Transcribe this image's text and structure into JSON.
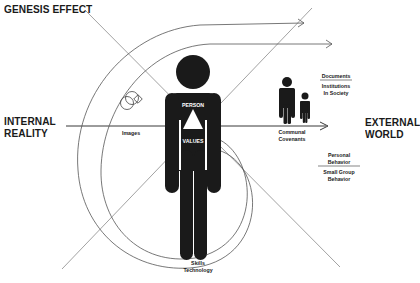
{
  "diagram": {
    "title": "GENESIS EFFECT",
    "left_label": [
      "INTERNAL",
      "REALITY"
    ],
    "right_label": [
      "EXTERNAL",
      "WORLD"
    ],
    "center_figure": {
      "top_label": "PERSON",
      "bottom_label": "VALUES",
      "symbol": "triangle"
    },
    "labels": {
      "images": "Images",
      "communal_covenants": [
        "Communal",
        "Covenants"
      ],
      "documents": "Documents",
      "institutions": [
        "Institutions",
        "In Society"
      ],
      "personal_behavior": [
        "Personal",
        "Behavior"
      ],
      "small_group_behavior": [
        "Small Group",
        "Behavior"
      ],
      "skills_technology": [
        "Skills",
        "Technology"
      ]
    },
    "colors": {
      "ink": "#1a1a1a",
      "line": "#7a7a7a",
      "background": "#ffffff"
    }
  }
}
